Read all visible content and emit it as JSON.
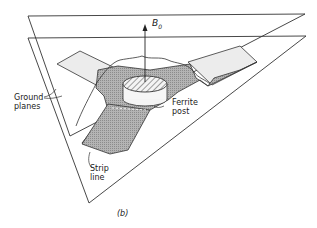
{
  "diagram": {
    "labels": {
      "field": "B",
      "field_sub": "0",
      "ground_line1": "Ground",
      "ground_line2": "planes",
      "ferrite_line1": "Ferrite",
      "ferrite_line2": "post",
      "strip_line1": "Strip",
      "strip_line2": "line",
      "caption": "(b)"
    },
    "colors": {
      "line": "#333333",
      "strip_fill": "#a9a9a9",
      "strip_light": "#ececec",
      "background": "#ffffff"
    }
  }
}
